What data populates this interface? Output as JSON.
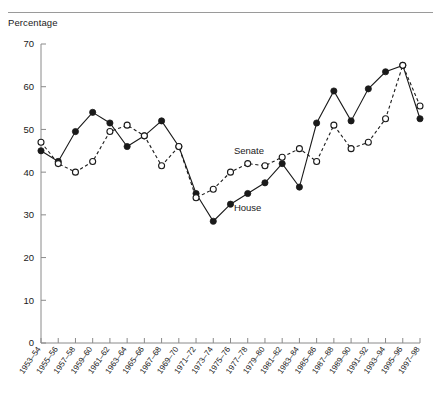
{
  "figure": {
    "y_axis_title": "Percentage"
  },
  "chart_data": {
    "type": "line",
    "title": "",
    "subtitle": "",
    "xlabel": "",
    "ylabel": "Percentage",
    "ylim": [
      0,
      70
    ],
    "yticks": [
      0,
      10,
      20,
      30,
      40,
      50,
      60,
      70
    ],
    "grid": false,
    "legend_position": "inline-annotations",
    "categories": [
      "1953–54",
      "1955–56",
      "1957–58",
      "1959–60",
      "1961–62",
      "1963–64",
      "1965–66",
      "1967–68",
      "1969–70",
      "1971–72",
      "1973–74",
      "1975–76",
      "1977–78",
      "1979–80",
      "1981–82",
      "1983–84",
      "1985–86",
      "1987–88",
      "1989–90",
      "1991–92",
      "1993–94",
      "1995–96",
      "1997–98"
    ],
    "series": [
      {
        "name": "House",
        "marker": "filled-circle",
        "linestyle": "solid",
        "values": [
          45,
          42.5,
          49.5,
          54,
          51.5,
          46,
          48.5,
          52,
          46,
          35,
          28.5,
          32.5,
          35,
          37.5,
          42,
          36.5,
          51.5,
          59,
          52,
          59.5,
          63.5,
          65,
          52.5
        ]
      },
      {
        "name": "Senate",
        "marker": "open-circle",
        "linestyle": "dashed",
        "values": [
          47,
          42,
          40,
          42.5,
          49.5,
          51,
          48.5,
          41.5,
          46,
          34,
          36,
          40,
          42,
          41.5,
          43.5,
          45.5,
          42.5,
          51,
          45.5,
          47,
          52.5,
          65,
          55.5
        ]
      }
    ],
    "annotations": [
      {
        "text": "Senate",
        "x_index": 11.2,
        "y_value": 44.2
      },
      {
        "text": "House",
        "x_index": 11.2,
        "y_value": 31.0
      }
    ]
  }
}
